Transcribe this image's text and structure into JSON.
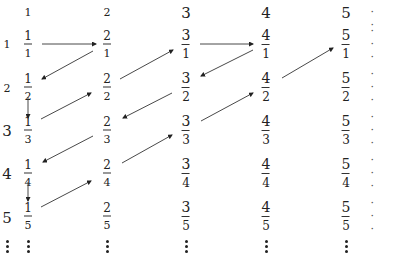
{
  "diagram": {
    "column_headers": [
      "1",
      "2",
      "3",
      "4",
      "5"
    ],
    "row_headers": [
      "1",
      "2",
      "3",
      "4",
      "5"
    ],
    "ellipsis_h": "· · ·",
    "cells": [
      [
        {
          "num": "1",
          "den": "1"
        },
        {
          "num": "2",
          "den": "1"
        },
        {
          "num": "3",
          "den": "1"
        },
        {
          "num": "4",
          "den": "1"
        },
        {
          "num": "5",
          "den": "1"
        }
      ],
      [
        {
          "num": "1",
          "den": "2"
        },
        {
          "num": "2",
          "den": "2"
        },
        {
          "num": "3",
          "den": "2"
        },
        {
          "num": "4",
          "den": "2"
        },
        {
          "num": "5",
          "den": "2"
        }
      ],
      [
        {
          "num": "1",
          "den": "3"
        },
        {
          "num": "2",
          "den": "3"
        },
        {
          "num": "3",
          "den": "3"
        },
        {
          "num": "4",
          "den": "3"
        },
        {
          "num": "5",
          "den": "3"
        }
      ],
      [
        {
          "num": "1",
          "den": "4"
        },
        {
          "num": "2",
          "den": "4"
        },
        {
          "num": "3",
          "den": "4"
        },
        {
          "num": "4",
          "den": "4"
        },
        {
          "num": "5",
          "den": "4"
        }
      ],
      [
        {
          "num": "1",
          "den": "5"
        },
        {
          "num": "2",
          "den": "5"
        },
        {
          "num": "3",
          "den": "5"
        },
        {
          "num": "4",
          "den": "5"
        },
        {
          "num": "5",
          "den": "5"
        }
      ]
    ],
    "path_order": [
      "1/1",
      "2/1",
      "1/2",
      "1/3",
      "2/2",
      "3/1",
      "4/1",
      "3/2",
      "2/3",
      "1/4",
      "1/5",
      "2/4",
      "3/3",
      "4/2",
      "5/1"
    ],
    "arrows": [
      {
        "from": "1/1",
        "to": "2/1",
        "x1": 42,
        "y1": 44,
        "x2": 96,
        "y2": 44
      },
      {
        "from": "2/1",
        "to": "1/2",
        "x1": 93,
        "y1": 51,
        "x2": 42,
        "y2": 79
      },
      {
        "from": "1/2",
        "to": "1/3",
        "x1": 28,
        "y1": 97,
        "x2": 28,
        "y2": 118
      },
      {
        "from": "1/3",
        "to": "2/2",
        "x1": 41,
        "y1": 119,
        "x2": 91,
        "y2": 93
      },
      {
        "from": "2/2",
        "to": "3/1",
        "x1": 120,
        "y1": 79,
        "x2": 173,
        "y2": 50
      },
      {
        "from": "3/1",
        "to": "4/1",
        "x1": 200,
        "y1": 44,
        "x2": 253,
        "y2": 44
      },
      {
        "from": "4/1",
        "to": "3/2",
        "x1": 253,
        "y1": 50,
        "x2": 201,
        "y2": 76
      },
      {
        "from": "3/2",
        "to": "2/3",
        "x1": 172,
        "y1": 93,
        "x2": 123,
        "y2": 118
      },
      {
        "from": "2/3",
        "to": "1/4",
        "x1": 93,
        "y1": 136,
        "x2": 43,
        "y2": 162
      },
      {
        "from": "1/4",
        "to": "1/5",
        "x1": 28,
        "y1": 182,
        "x2": 28,
        "y2": 201
      },
      {
        "from": "1/5",
        "to": "2/4",
        "x1": 41,
        "y1": 207,
        "x2": 91,
        "y2": 181
      },
      {
        "from": "2/4",
        "to": "3/3",
        "x1": 122,
        "y1": 163,
        "x2": 172,
        "y2": 135
      },
      {
        "from": "3/3",
        "to": "4/2",
        "x1": 201,
        "y1": 121,
        "x2": 253,
        "y2": 93
      },
      {
        "from": "4/2",
        "to": "5/1",
        "x1": 282,
        "y1": 78,
        "x2": 333,
        "y2": 48
      }
    ]
  }
}
